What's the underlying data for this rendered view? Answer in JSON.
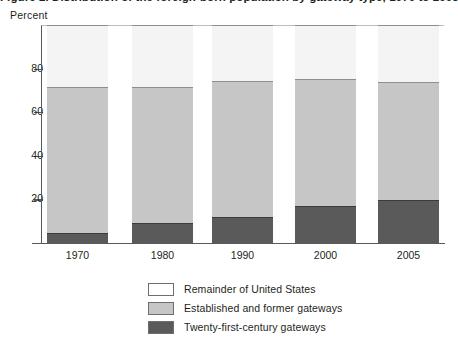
{
  "figure": {
    "clipped_title": "Figure 2. Distribution of the foreign-born population by gateway type, 1970 to 2005",
    "y_axis_label": "Percent"
  },
  "chart_data": {
    "type": "bar",
    "stacked": true,
    "title": "",
    "xlabel": "",
    "ylabel": "Percent",
    "ylim": [
      0,
      100
    ],
    "yticks": [
      20,
      40,
      60,
      80
    ],
    "grid": false,
    "legend_position": "bottom",
    "categories": [
      "1970",
      "1980",
      "1990",
      "2000",
      "2005"
    ],
    "series": [
      {
        "name": "Twenty-first-century gateways",
        "color": "#5a5a5a",
        "values": [
          5.0,
          9.5,
          12.5,
          17.5,
          20.0
        ]
      },
      {
        "name": "Established and former gateways",
        "color": "#c6c6c6",
        "values": [
          67.0,
          62.5,
          62.5,
          58.0,
          54.5
        ]
      },
      {
        "name": "Remainder of United States",
        "color": "#ffffff",
        "values": [
          28.0,
          28.0,
          25.0,
          24.5,
          25.5
        ]
      }
    ],
    "cumulative_tops": {
      "twentyfirst": [
        5.0,
        9.5,
        12.5,
        17.5,
        20.0
      ],
      "established": [
        72.0,
        72.0,
        75.0,
        75.5,
        74.5
      ],
      "remainder": [
        100,
        100,
        100,
        100,
        100
      ]
    }
  },
  "legend": {
    "items": [
      {
        "label": "Remainder of United States",
        "swatch": "remainder"
      },
      {
        "label": "Established and former gateways",
        "swatch": "established"
      },
      {
        "label": "Twenty-first-century gateways",
        "swatch": "twentyfirst"
      }
    ]
  }
}
